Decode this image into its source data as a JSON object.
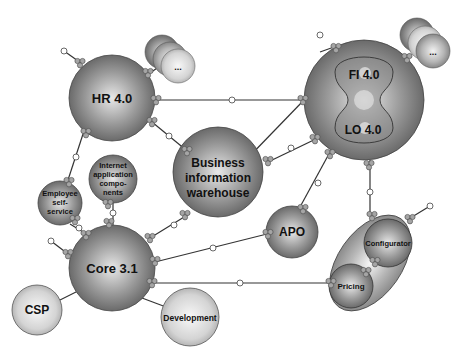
{
  "diagram": {
    "nodes": {
      "hr": {
        "label": "HR 4.0"
      },
      "fi": {
        "label": "FI 4.0"
      },
      "lo": {
        "label": "LO 4.0"
      },
      "biw": {
        "lines": [
          "Business",
          "information",
          "warehouse"
        ]
      },
      "core": {
        "label": "Core 3.1"
      },
      "ess": {
        "lines": [
          "Employee",
          "self-",
          "service"
        ]
      },
      "iac": {
        "lines": [
          "Internet",
          "application",
          "compo-",
          "nents"
        ]
      },
      "apo": {
        "label": "APO"
      },
      "csp": {
        "label": "CSP"
      },
      "dev": {
        "label": "Development"
      },
      "configurator": {
        "label": "Configurator"
      },
      "pricing": {
        "label": "Pricing"
      },
      "more_hr": {
        "label": "..."
      },
      "more_fi": {
        "label": "..."
      }
    },
    "colors": {
      "dark_sphere": "#6e6e6e",
      "light_sphere": "#d0d0d0",
      "line": "#333333",
      "connector": "#9a9a9a"
    }
  }
}
